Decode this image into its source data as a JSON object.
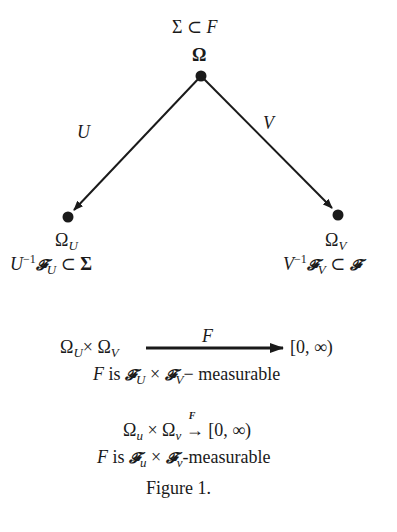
{
  "diagram": {
    "top_node": {
      "annotation": {
        "sigma": "Σ",
        "subset": "⊂",
        "F": "F"
      },
      "label": "Ω"
    },
    "left_node": {
      "label_main": "Ω",
      "label_sub": "U",
      "annotation": {
        "map": "U",
        "inv": "−1",
        "script": "𝓕",
        "script_sub": "U",
        "subset": "⊂",
        "sigma": "Σ"
      }
    },
    "right_node": {
      "label_main": "Ω",
      "label_sub": "V",
      "annotation": {
        "map": "V",
        "inv": "−1",
        "script": "𝓕",
        "script_sub": "V",
        "subset": "⊂",
        "script2": "𝓕"
      }
    },
    "edges": [
      {
        "from": "Ω",
        "to": "Ω_U",
        "label": "U"
      },
      {
        "from": "Ω",
        "to": "Ω_V",
        "label": "V"
      }
    ]
  },
  "product_map": {
    "domain_left": "Ω",
    "domain_left_sub": "U",
    "times": "×",
    "domain_right": "Ω",
    "domain_right_sub": "V",
    "arrow_label": "F",
    "codomain": "[0, ∞)",
    "measurable_line": {
      "F": "F",
      "is": " is ",
      "script1": "𝓕",
      "sub1": "U",
      "times": "×",
      "script2": "𝓕",
      "sub2": "V",
      "suffix": "− measurable"
    }
  },
  "product_map_2": {
    "domain_left": "Ω",
    "domain_left_sub": "u",
    "times": "×",
    "domain_right": "Ω",
    "domain_right_sub": "v",
    "arrow": "→",
    "arrow_label": "F",
    "codomain": "[0, ∞)",
    "measurable_line": {
      "F": "F",
      "is": " is ",
      "script1": "𝓕",
      "sub1": "u",
      "times": "×",
      "script2": "𝓕",
      "sub2": "v",
      "suffix": "-measurable"
    }
  },
  "caption": "Figure 1."
}
